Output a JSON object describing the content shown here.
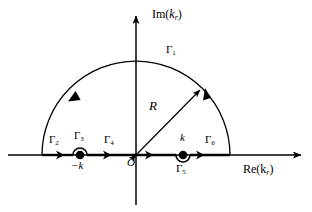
{
  "figure": {
    "type": "complex-plane-contour-diagram",
    "axes": {
      "imaginary_label_prefix": "Im(",
      "imaginary_label_var": "k",
      "imaginary_label_sub": "r",
      "imaginary_label_suffix": ")",
      "real_label_prefix": "Re(",
      "real_label_var": "k",
      "real_label_sub": "r",
      "real_label_suffix": ")",
      "origin_label": "O"
    },
    "radius": {
      "label": "R"
    },
    "poles": [
      {
        "name": "pole-negative-k",
        "label": "−k",
        "detour": "above"
      },
      {
        "name": "pole-positive-k",
        "label": "k",
        "detour": "below"
      }
    ],
    "contours": [
      {
        "id": "G1",
        "symbol": "Γ",
        "sub": "1",
        "part": "large-arc"
      },
      {
        "id": "G2",
        "symbol": "Γ",
        "sub": "2",
        "part": "real-segment-left"
      },
      {
        "id": "G3",
        "symbol": "Γ",
        "sub": "3",
        "part": "small-arc-negative-k"
      },
      {
        "id": "G4",
        "symbol": "Γ",
        "sub": "4",
        "part": "real-segment-middle"
      },
      {
        "id": "G5",
        "symbol": "Γ",
        "sub": "5",
        "part": "small-arc-positive-k"
      },
      {
        "id": "G6",
        "symbol": "Γ",
        "sub": "6",
        "part": "real-segment-right"
      }
    ],
    "colors": {
      "ink": "#000000",
      "background": "#ffffff"
    }
  }
}
